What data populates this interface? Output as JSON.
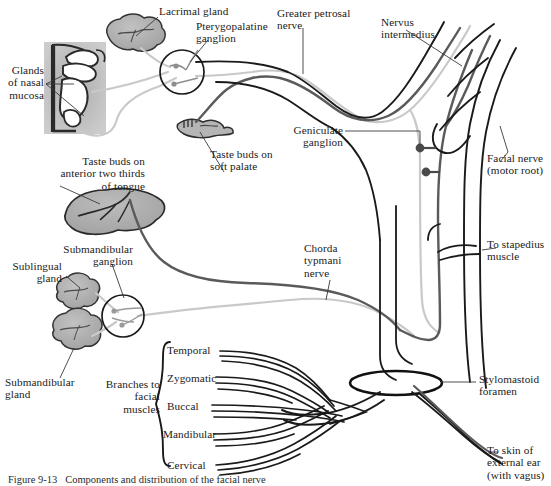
{
  "figure": {
    "caption": "Figure 9-13   Components and distribution of the facial nerve"
  },
  "colors": {
    "motor_black": "#1a1a1a",
    "taste_gray": "#5a5a5a",
    "parasympathetic_light": "#c9c9c9",
    "gland_fill": "#b3b3b3",
    "gland_stroke": "#333333",
    "tongue_fill": "#b0b0b0",
    "nasal_fill": "#a8a8a8",
    "text": "#1a1a1a"
  },
  "labels": {
    "lacrimal_gland": "Lacrimal gland",
    "pterygopalatine_ganglion": "Pterygopalatine\nganglion",
    "greater_petrosal_nerve": "Greater petrosal\nnerve",
    "nervus_intermedius": "Nervus\nintermedius",
    "glands_of_nasal_mucosa": "Glands\nof nasal\nmucosa",
    "geniculate_ganglion": "Geniculate\nganglion",
    "facial_nerve_motor_root": "Facial nerve\n(motor root)",
    "taste_buds_soft_palate": "Taste buds on\nsoft palate",
    "taste_buds_tongue": "Taste buds on\nanterior two thirds\nof tongue",
    "submandibular_ganglion": "Submandibular\nganglion",
    "sublingual_gland": "Sublingual\ngland",
    "submandibular_gland": "Submandibular\ngland",
    "chorda_tympani_nerve": "Chorda\ntypmani\nnerve",
    "to_stapedius_muscle": "To stapedius\nmuscle",
    "stylomastoid_foramen": "Stylomastoid\nforamen",
    "to_skin_external_ear": "To skin of\nexternal ear\n(with vagus)",
    "branches_to_facial_muscles": "Branches to\nfacial\nmuscles"
  },
  "facial_branches": [
    {
      "name": "Temporal"
    },
    {
      "name": "Zygomatic"
    },
    {
      "name": "Buccal"
    },
    {
      "name": "Mandibular"
    },
    {
      "name": "Cervical"
    }
  ]
}
